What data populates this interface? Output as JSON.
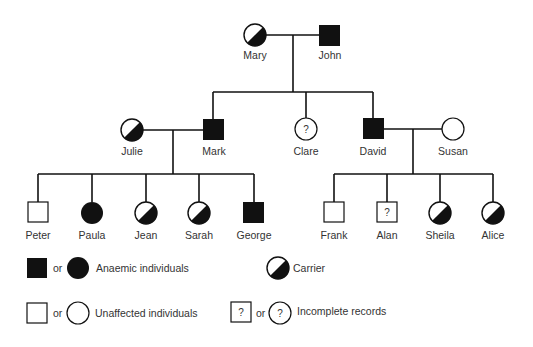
{
  "colors": {
    "ink": "#111111",
    "paper": "#ffffff",
    "text": "#333333"
  },
  "generations": {
    "gen1": [
      {
        "name": "Mary",
        "sex": "female",
        "status": "carrier"
      },
      {
        "name": "John",
        "sex": "male",
        "status": "anaemic"
      }
    ],
    "gen2": [
      {
        "name": "Julie",
        "sex": "female",
        "status": "carrier",
        "relation": "spouse of Mark"
      },
      {
        "name": "Mark",
        "sex": "male",
        "status": "anaemic",
        "relation": "child of Mary & John"
      },
      {
        "name": "Clare",
        "sex": "female",
        "status": "incomplete",
        "relation": "child of Mary & John"
      },
      {
        "name": "David",
        "sex": "male",
        "status": "anaemic",
        "relation": "child of Mary & John"
      },
      {
        "name": "Susan",
        "sex": "female",
        "status": "unaffected",
        "relation": "spouse of David"
      }
    ],
    "gen3_mark_julie": [
      {
        "name": "Peter",
        "sex": "male",
        "status": "unaffected"
      },
      {
        "name": "Paula",
        "sex": "female",
        "status": "anaemic"
      },
      {
        "name": "Jean",
        "sex": "female",
        "status": "carrier"
      },
      {
        "name": "Sarah",
        "sex": "female",
        "status": "carrier"
      },
      {
        "name": "George",
        "sex": "male",
        "status": "anaemic"
      }
    ],
    "gen3_david_susan": [
      {
        "name": "Frank",
        "sex": "male",
        "status": "unaffected"
      },
      {
        "name": "Alan",
        "sex": "male",
        "status": "incomplete"
      },
      {
        "name": "Sheila",
        "sex": "female",
        "status": "carrier"
      },
      {
        "name": "Alice",
        "sex": "female",
        "status": "carrier"
      }
    ]
  },
  "labels": {
    "mary": "Mary",
    "john": "John",
    "julie": "Julie",
    "mark": "Mark",
    "clare": "Clare",
    "david": "David",
    "susan": "Susan",
    "peter": "Peter",
    "paula": "Paula",
    "jean": "Jean",
    "sarah": "Sarah",
    "george": "George",
    "frank": "Frank",
    "alan": "Alan",
    "sheila": "Sheila",
    "alice": "Alice"
  },
  "legend": {
    "or": "or",
    "anaemic": "Anaemic individuals",
    "carrier": "Carrier",
    "unaffected": "Unaffected individuals",
    "incomplete": "Incomplete records",
    "question_mark": "?"
  }
}
